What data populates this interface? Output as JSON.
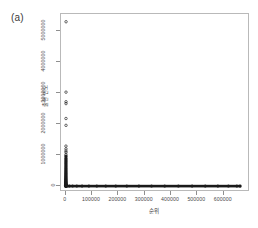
{
  "figure": {
    "panel_label": "(a)",
    "background_color": "#ffffff",
    "frame_color": "#b9b9b9",
    "point_color": "#1a1a1a"
  },
  "chart_data": {
    "type": "scatter",
    "title": "(a)",
    "xlabel": "순위",
    "ylabel": "출현 빈도",
    "xlim": [
      -18000,
      700000
    ],
    "ylim": [
      -190000,
      5550000
    ],
    "grid": false,
    "legend": null,
    "x_ticks": [
      0,
      100000,
      200000,
      300000,
      400000,
      500000,
      600000
    ],
    "x_tick_labels": [
      "0",
      "100000",
      "200000",
      "300000",
      "400000",
      "500000",
      "600000"
    ],
    "y_ticks": [
      0,
      1000000,
      2000000,
      3000000,
      4000000,
      5000000
    ],
    "y_tick_labels": [
      "0",
      "1000000",
      "2000000",
      "3000000",
      "4000000",
      "5000000"
    ],
    "series": [
      {
        "name": "rank-frequency",
        "marker": "open-circle",
        "points": [
          [
            1200,
            5300000
          ],
          [
            1000,
            3030000
          ],
          [
            1100,
            2720000
          ],
          [
            1000,
            2660000
          ],
          [
            900,
            2180000
          ],
          [
            1000,
            1960000
          ],
          [
            800,
            1290000
          ],
          [
            900,
            1200000
          ],
          [
            800,
            1130000
          ],
          [
            1000,
            1080000
          ],
          [
            700,
            1010000
          ],
          [
            900,
            960000
          ],
          [
            800,
            900000
          ],
          [
            700,
            860000
          ],
          [
            900,
            820000
          ],
          [
            800,
            780000
          ],
          [
            700,
            740000
          ],
          [
            600,
            700000
          ],
          [
            800,
            660000
          ],
          [
            700,
            620000
          ],
          [
            600,
            580000
          ],
          [
            700,
            545000
          ],
          [
            600,
            510000
          ],
          [
            500,
            480000
          ],
          [
            600,
            450000
          ],
          [
            500,
            420000
          ],
          [
            600,
            392000
          ],
          [
            500,
            365000
          ],
          [
            400,
            340000
          ],
          [
            500,
            316000
          ],
          [
            400,
            293000
          ],
          [
            500,
            271000
          ],
          [
            400,
            250000
          ],
          [
            300,
            231000
          ],
          [
            400,
            213000
          ],
          [
            300,
            196000
          ],
          [
            400,
            180000
          ],
          [
            300,
            165000
          ],
          [
            400,
            151000
          ],
          [
            300,
            138000
          ],
          [
            200,
            126000
          ],
          [
            300,
            115000
          ],
          [
            200,
            104000
          ],
          [
            300,
            94000
          ],
          [
            200,
            85000
          ],
          [
            300,
            76000
          ],
          [
            200,
            68000
          ],
          [
            200,
            61000
          ],
          [
            200,
            54000
          ],
          [
            200,
            48000
          ],
          [
            200,
            42000
          ],
          [
            200,
            37000
          ],
          [
            100,
            32000
          ],
          [
            200,
            28000
          ],
          [
            100,
            24000
          ],
          [
            200,
            20000
          ],
          [
            100,
            17000
          ],
          [
            100,
            14000
          ],
          [
            100,
            11000
          ],
          [
            100,
            9000
          ],
          [
            100,
            7000
          ],
          [
            100,
            5000
          ],
          [
            100,
            3500
          ],
          [
            100,
            2500
          ],
          [
            100,
            1600
          ],
          [
            100,
            1000
          ],
          [
            2000,
            600
          ],
          [
            6000,
            400
          ],
          [
            14000,
            300
          ],
          [
            26000,
            220
          ],
          [
            42000,
            170
          ],
          [
            62000,
            130
          ],
          [
            88000,
            100
          ],
          [
            118000,
            80
          ],
          [
            152000,
            62
          ],
          [
            190000,
            48
          ],
          [
            232000,
            38
          ],
          [
            278000,
            29
          ],
          [
            326000,
            22
          ],
          [
            376000,
            17
          ],
          [
            428000,
            13
          ],
          [
            480000,
            9
          ],
          [
            530000,
            6
          ],
          [
            578000,
            4
          ],
          [
            618000,
            2
          ],
          [
            650000,
            1
          ],
          [
            662000,
            1
          ]
        ]
      }
    ]
  },
  "axes": {
    "y_title": "출현 빈도",
    "x_title": "순위"
  }
}
